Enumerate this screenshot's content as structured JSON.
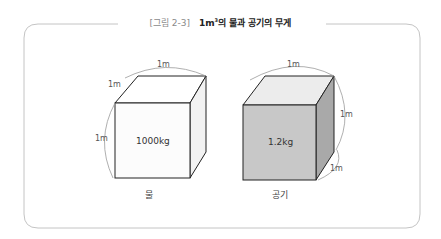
{
  "figure": {
    "number": "[그림 2-3]",
    "title_prefix": "1m",
    "title_sup": "3",
    "title_suffix": "의 물과 공기의 무게"
  },
  "cubes": [
    {
      "name": "water",
      "caption": "물",
      "weight": "1000kg",
      "front_color": "#fcfcfc",
      "top_color": "#ffffff",
      "side_color": "#f2f2f2",
      "dimension_labels": [
        "1m",
        "1m",
        "1m"
      ]
    },
    {
      "name": "air",
      "caption": "공기",
      "weight": "1.2kg",
      "front_color": "#c8c8c8",
      "top_color": "#ececec",
      "side_color": "#a9a9a9",
      "dimension_labels": [
        "1m",
        "1m",
        "1m"
      ]
    }
  ],
  "colors": {
    "frame": "#c4c4c4",
    "edge": "#222222",
    "dim_arc": "#9a9a9a"
  }
}
